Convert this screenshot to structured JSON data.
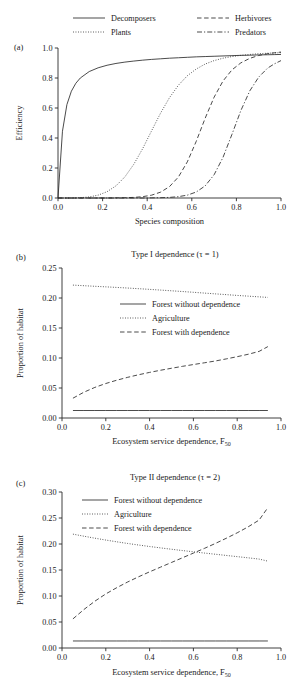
{
  "figure": {
    "panels": [
      "a",
      "b",
      "c"
    ]
  },
  "panel_a": {
    "label": "(a)",
    "legend": [
      {
        "name": "Decomposers",
        "style": "solid"
      },
      {
        "name": "Herbivores",
        "style": "dashed"
      },
      {
        "name": "Plants",
        "style": "dotted"
      },
      {
        "name": "Predators",
        "style": "dashdot"
      }
    ],
    "chart_data": {
      "type": "line",
      "title": "",
      "xlabel": "Species composition",
      "ylabel": "Efficiency",
      "xlim": [
        0.0,
        1.0
      ],
      "ylim": [
        0.0,
        1.0
      ],
      "xticks": [
        "0.0",
        "0.2",
        "0.4",
        "0.6",
        "0.8",
        "1.0"
      ],
      "xtickvals": [
        0.0,
        0.2,
        0.4,
        0.6,
        0.8,
        1.0
      ],
      "yticks": [
        "0.0",
        "0.2",
        "0.4",
        "0.6",
        "0.8",
        "1.0"
      ],
      "ytickvals": [
        0.0,
        0.2,
        0.4,
        0.6,
        0.8,
        1.0
      ],
      "grid": false,
      "legend_position": "above-plot",
      "x": [
        0.0,
        0.02,
        0.04,
        0.06,
        0.08,
        0.1,
        0.14,
        0.18,
        0.22,
        0.26,
        0.3,
        0.34,
        0.38,
        0.42,
        0.46,
        0.5,
        0.54,
        0.58,
        0.62,
        0.66,
        0.7,
        0.74,
        0.78,
        0.82,
        0.86,
        0.9,
        0.94,
        0.97,
        1.0
      ],
      "series": [
        {
          "name": "Decomposers",
          "style": "solid",
          "values": [
            0.0,
            0.445,
            0.623,
            0.712,
            0.765,
            0.8,
            0.843,
            0.868,
            0.885,
            0.897,
            0.906,
            0.913,
            0.919,
            0.924,
            0.928,
            0.932,
            0.935,
            0.938,
            0.941,
            0.943,
            0.945,
            0.947,
            0.949,
            0.951,
            0.952,
            0.954,
            0.955,
            0.956,
            0.957
          ]
        },
        {
          "name": "Plants",
          "style": "dotted",
          "values": [
            0.0,
            0.0,
            0.0,
            0.0,
            0.001,
            0.002,
            0.007,
            0.019,
            0.042,
            0.081,
            0.141,
            0.225,
            0.33,
            0.449,
            0.566,
            0.669,
            0.752,
            0.815,
            0.86,
            0.893,
            0.916,
            0.932,
            0.943,
            0.951,
            0.957,
            0.962,
            0.965,
            0.967,
            0.969
          ]
        },
        {
          "name": "Herbivores",
          "style": "dashed",
          "values": [
            0.0,
            0.0,
            0.0,
            0.0,
            0.0,
            0.0,
            0.0,
            0.0,
            0.0,
            0.001,
            0.002,
            0.004,
            0.009,
            0.019,
            0.039,
            0.076,
            0.14,
            0.241,
            0.378,
            0.532,
            0.672,
            0.78,
            0.854,
            0.901,
            0.931,
            0.95,
            0.962,
            0.968,
            0.973
          ]
        },
        {
          "name": "Predators",
          "style": "dashdot",
          "values": [
            0.0,
            0.0,
            0.0,
            0.0,
            0.0,
            0.0,
            0.0,
            0.0,
            0.0,
            0.0,
            0.0,
            0.0,
            0.0,
            0.001,
            0.002,
            0.004,
            0.009,
            0.019,
            0.04,
            0.081,
            0.155,
            0.271,
            0.424,
            0.583,
            0.714,
            0.806,
            0.866,
            0.894,
            0.916
          ]
        }
      ]
    }
  },
  "panel_b": {
    "label": "(b)",
    "title": "Type I dependence (τ = 1)",
    "legend": [
      {
        "name": "Forest without dependence",
        "style": "solid"
      },
      {
        "name": "Agriculture",
        "style": "dotted"
      },
      {
        "name": "Forest with dependence",
        "style": "dashed"
      }
    ],
    "chart_data": {
      "type": "line",
      "title": "Type I dependence (τ = 1)",
      "xlabel": "Ecosystem service dependence, F",
      "xlabel_sub": "50",
      "ylabel": "Proportion of habitat",
      "xlim": [
        0.0,
        1.0
      ],
      "ylim": [
        0.0,
        0.25
      ],
      "xticks": [
        "0.0",
        "0.2",
        "0.4",
        "0.6",
        "0.8",
        "1.0"
      ],
      "xtickvals": [
        0.0,
        0.2,
        0.4,
        0.6,
        0.8,
        1.0
      ],
      "yticks": [
        "0.00",
        "0.05",
        "0.10",
        "0.15",
        "0.20",
        "0.25"
      ],
      "ytickvals": [
        0.0,
        0.05,
        0.1,
        0.15,
        0.2,
        0.25
      ],
      "grid": false,
      "legend_position": "center-right",
      "x": [
        0.05,
        0.1,
        0.15,
        0.2,
        0.25,
        0.3,
        0.35,
        0.4,
        0.45,
        0.5,
        0.55,
        0.6,
        0.65,
        0.7,
        0.75,
        0.8,
        0.85,
        0.9,
        0.94
      ],
      "series": [
        {
          "name": "Forest without dependence",
          "style": "solid",
          "values": [
            0.0125,
            0.0125,
            0.0125,
            0.0125,
            0.0125,
            0.0125,
            0.0125,
            0.0125,
            0.0125,
            0.0125,
            0.0125,
            0.0125,
            0.0125,
            0.0125,
            0.0125,
            0.0125,
            0.0125,
            0.0125,
            0.0125
          ]
        },
        {
          "name": "Agriculture",
          "style": "dotted",
          "values": [
            0.2215,
            0.2205,
            0.2195,
            0.2186,
            0.2176,
            0.2166,
            0.2155,
            0.2144,
            0.2132,
            0.212,
            0.2108,
            0.2095,
            0.2082,
            0.2069,
            0.2056,
            0.2043,
            0.2031,
            0.2019,
            0.201
          ]
        },
        {
          "name": "Forest with dependence",
          "style": "dashed",
          "values": [
            0.033,
            0.043,
            0.051,
            0.0575,
            0.063,
            0.0678,
            0.0721,
            0.076,
            0.0796,
            0.0829,
            0.0861,
            0.0891,
            0.092,
            0.095,
            0.0985,
            0.1022,
            0.1062,
            0.111,
            0.119
          ]
        }
      ]
    }
  },
  "panel_c": {
    "label": "(c)",
    "title": "Type II dependence (τ = 2)",
    "legend": [
      {
        "name": "Forest without dependence",
        "style": "solid"
      },
      {
        "name": "Agriculture",
        "style": "dotted"
      },
      {
        "name": "Forest with dependence",
        "style": "dashed"
      }
    ],
    "chart_data": {
      "type": "line",
      "title": "Type II dependence (τ = 2)",
      "xlabel": "Ecosystem service dependence, F",
      "xlabel_sub": "50",
      "ylabel": "Proportion of habitat",
      "xlim": [
        0.0,
        1.0
      ],
      "ylim": [
        0.0,
        0.3
      ],
      "xticks": [
        "0.0",
        "0.2",
        "0.4",
        "0.6",
        "0.8",
        "1.0"
      ],
      "xtickvals": [
        0.0,
        0.2,
        0.4,
        0.6,
        0.8,
        1.0
      ],
      "yticks": [
        "0.00",
        "0.05",
        "0.10",
        "0.15",
        "0.20",
        "0.25",
        "0.30"
      ],
      "ytickvals": [
        0.0,
        0.05,
        0.1,
        0.15,
        0.2,
        0.25,
        0.3
      ],
      "grid": false,
      "legend_position": "upper-left",
      "x": [
        0.05,
        0.1,
        0.15,
        0.2,
        0.25,
        0.3,
        0.35,
        0.4,
        0.45,
        0.5,
        0.55,
        0.6,
        0.65,
        0.7,
        0.75,
        0.8,
        0.85,
        0.9,
        0.94
      ],
      "series": [
        {
          "name": "Forest without dependence",
          "style": "solid",
          "values": [
            0.0135,
            0.0135,
            0.0135,
            0.0135,
            0.0135,
            0.0135,
            0.0135,
            0.0135,
            0.0135,
            0.0135,
            0.0135,
            0.0135,
            0.0135,
            0.0135,
            0.0135,
            0.0135,
            0.0135,
            0.0135,
            0.0135
          ]
        },
        {
          "name": "Agriculture",
          "style": "dotted",
          "values": [
            0.219,
            0.215,
            0.2112,
            0.2076,
            0.2042,
            0.201,
            0.198,
            0.1952,
            0.1925,
            0.1899,
            0.1874,
            0.185,
            0.1826,
            0.1803,
            0.178,
            0.1757,
            0.1734,
            0.171,
            0.167
          ]
        },
        {
          "name": "Forest with dependence",
          "style": "dashed",
          "values": [
            0.056,
            0.074,
            0.09,
            0.104,
            0.116,
            0.127,
            0.137,
            0.1465,
            0.1555,
            0.1645,
            0.1735,
            0.1825,
            0.1915,
            0.201,
            0.211,
            0.2215,
            0.233,
            0.246,
            0.27
          ]
        }
      ]
    }
  }
}
